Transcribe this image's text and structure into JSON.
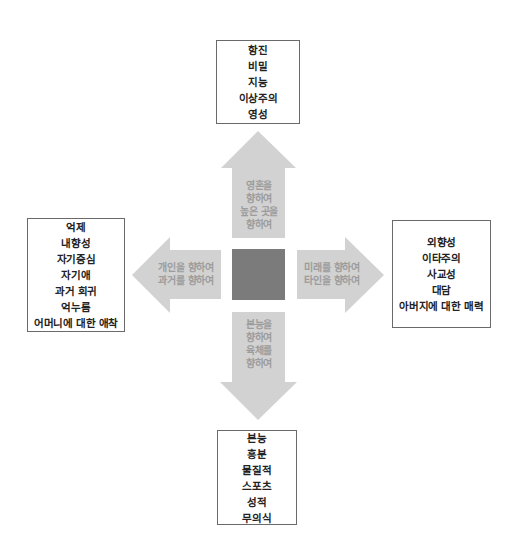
{
  "colors": {
    "arrow_fill": "#d2d2d2",
    "arrow_text": "#9c9c9c",
    "center_square": "#7b7b7b",
    "box_border": "#6a6a6a",
    "box_text": "#222222"
  },
  "center": {
    "label": ""
  },
  "boxes": {
    "top": {
      "lines": [
        "항진",
        "비밀",
        "지능",
        "이상주의",
        "영성"
      ]
    },
    "left": {
      "lines": [
        "억제",
        "내향성",
        "자기중심",
        "자기애",
        "과거 회귀",
        "억누름",
        "어머니에 대한 애착"
      ]
    },
    "right": {
      "lines": [
        "외향성",
        "이타주의",
        "사교성",
        "대담",
        "아버지에 대한 매력"
      ]
    },
    "bottom": {
      "lines": [
        "본능",
        "흥분",
        "물질적",
        "스포츠",
        "성적",
        "무의식"
      ]
    }
  },
  "arrows": {
    "up": {
      "direction": "up",
      "lines": [
        "영혼을",
        "향하여",
        "높은 곳을",
        "향하여"
      ]
    },
    "left": {
      "direction": "left",
      "lines": [
        "개인을 향하여",
        "과거를 향하여"
      ]
    },
    "right": {
      "direction": "right",
      "lines": [
        "미래를 향하여",
        "타인을 향하여"
      ]
    },
    "down": {
      "direction": "down",
      "lines": [
        "본능을",
        "향하여",
        "육체를",
        "향하여"
      ]
    }
  }
}
